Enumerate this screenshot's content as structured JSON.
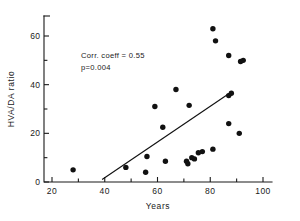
{
  "chart_data": {
    "type": "scatter",
    "title": "",
    "xlabel": "Years",
    "ylabel": "HVA/DA ratio",
    "xlim": [
      15,
      103
    ],
    "ylim": [
      0,
      67
    ],
    "grid": false,
    "legend": null,
    "x_ticks_major": [
      20,
      40,
      60,
      80,
      100
    ],
    "x_ticks_minor": [
      30,
      50,
      70,
      90
    ],
    "y_ticks_major": [
      0,
      20,
      40,
      60
    ],
    "y_ticks_minor": [
      10,
      30,
      50
    ],
    "x_tick_labels": [
      "20",
      "40",
      "60",
      "80",
      "100"
    ],
    "y_tick_labels": [
      "0",
      "20",
      "40",
      "60"
    ],
    "points": [
      {
        "x": 28,
        "y": 5
      },
      {
        "x": 48,
        "y": 6
      },
      {
        "x": 55.5,
        "y": 4
      },
      {
        "x": 56,
        "y": 10.5
      },
      {
        "x": 59,
        "y": 31
      },
      {
        "x": 62,
        "y": 22.5
      },
      {
        "x": 63,
        "y": 8.5
      },
      {
        "x": 67,
        "y": 38
      },
      {
        "x": 71,
        "y": 8.5
      },
      {
        "x": 71.5,
        "y": 7.5
      },
      {
        "x": 72,
        "y": 31.5
      },
      {
        "x": 73,
        "y": 10
      },
      {
        "x": 74,
        "y": 9.5
      },
      {
        "x": 75.5,
        "y": 12
      },
      {
        "x": 77,
        "y": 12.5
      },
      {
        "x": 81,
        "y": 13.5
      },
      {
        "x": 81,
        "y": 63
      },
      {
        "x": 82,
        "y": 58
      },
      {
        "x": 87,
        "y": 52
      },
      {
        "x": 87,
        "y": 24
      },
      {
        "x": 87,
        "y": 35.5
      },
      {
        "x": 88,
        "y": 36.5
      },
      {
        "x": 91,
        "y": 20
      },
      {
        "x": 91.5,
        "y": 49.5
      },
      {
        "x": 92.5,
        "y": 50
      }
    ],
    "fit_line": {
      "x_start": 39,
      "y_start": 1,
      "x_end": 88,
      "y_end": 37
    },
    "annotations": [
      {
        "text": "Corr. coeff = 0.55",
        "x": 31,
        "y": 51
      },
      {
        "text": "p=0.004",
        "x": 31,
        "y": 46
      }
    ]
  },
  "stats": {
    "corr_coeff": "0.55",
    "p_value": "0.004"
  }
}
